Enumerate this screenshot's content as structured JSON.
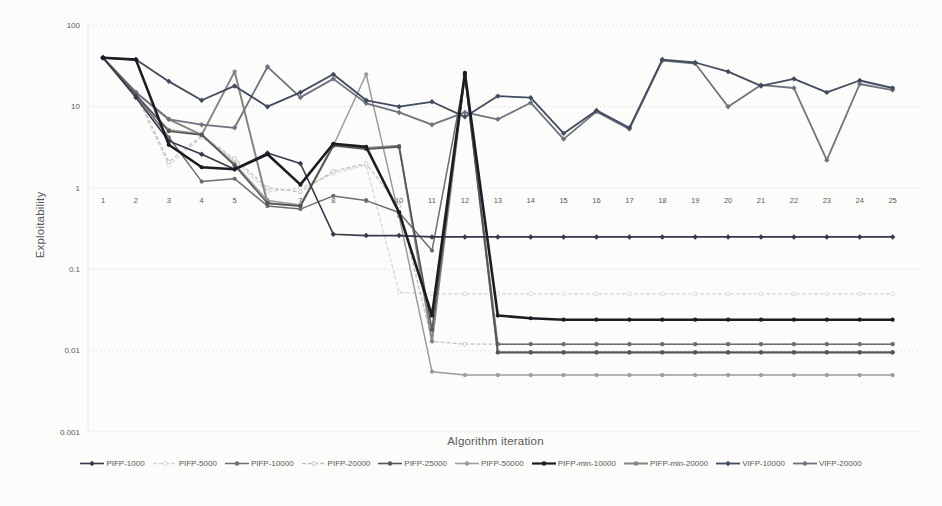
{
  "chart_data": {
    "type": "line",
    "title": "",
    "xlabel": "Algorithm iteration",
    "ylabel": "Exploitability",
    "yscale": "log",
    "ylim": [
      0.001,
      100
    ],
    "yticks": [
      100,
      10,
      1,
      0.1,
      0.01,
      0.001
    ],
    "ytick_labels": [
      "100",
      "10",
      "1",
      "0.1",
      "0.01",
      "0.001"
    ],
    "grid": true,
    "gridline_color": "#dbdbdb",
    "tick_label_color": "#595959",
    "legend_position": "bottom",
    "x": [
      1,
      2,
      3,
      4,
      5,
      6,
      7,
      8,
      9,
      10,
      11,
      12,
      13,
      14,
      15,
      16,
      17,
      18,
      19,
      20,
      21,
      22,
      23,
      24,
      25
    ],
    "series": [
      {
        "name": "PIFP-1000",
        "color": "#343a4c",
        "width": 1.6,
        "dash": "",
        "marker": "diamond",
        "values": [
          40,
          13,
          3.8,
          2.6,
          1.7,
          2.7,
          2.0,
          0.27,
          0.26,
          0.26,
          0.25,
          0.25,
          0.25,
          0.25,
          0.25,
          0.25,
          0.25,
          0.25,
          0.25,
          0.25,
          0.25,
          0.25,
          0.25,
          0.25,
          0.25
        ]
      },
      {
        "name": "PIFP-5000",
        "color": "#d7d7d7",
        "width": 1.3,
        "dash": "4 2",
        "marker": "circle-open",
        "values": [
          41,
          14,
          1.9,
          4.2,
          2.2,
          0.9,
          1.0,
          1.5,
          1.9,
          0.052,
          0.05,
          0.05,
          0.05,
          0.05,
          0.05,
          0.05,
          0.05,
          0.05,
          0.05,
          0.05,
          0.05,
          0.05,
          0.05,
          0.05,
          0.05
        ]
      },
      {
        "name": "PIFP-10000",
        "color": "#6d6d6d",
        "width": 1.5,
        "dash": "",
        "marker": "circle",
        "values": [
          40,
          14,
          4.2,
          1.2,
          1.3,
          0.6,
          0.55,
          0.8,
          0.7,
          0.5,
          0.17,
          24,
          0.012,
          0.012,
          0.012,
          0.012,
          0.012,
          0.012,
          0.012,
          0.012,
          0.012,
          0.012,
          0.012,
          0.012,
          0.012
        ]
      },
      {
        "name": "PIFP-20000",
        "color": "#c2c2c2",
        "width": 1.3,
        "dash": "4 2",
        "marker": "circle-open",
        "values": [
          40,
          15,
          2.1,
          4.4,
          2.3,
          1.0,
          0.9,
          1.6,
          2.0,
          0.6,
          0.013,
          0.012,
          0.012,
          0.012,
          0.012,
          0.012,
          0.012,
          0.012,
          0.012,
          0.012,
          0.012,
          0.012,
          0.012,
          0.012,
          0.012
        ]
      },
      {
        "name": "PIFP-25000",
        "color": "#555555",
        "width": 1.6,
        "dash": "",
        "marker": "circle",
        "values": [
          40,
          14,
          5.0,
          4.5,
          1.9,
          0.65,
          0.6,
          3.3,
          3.0,
          3.2,
          0.018,
          25,
          0.0095,
          0.0095,
          0.0095,
          0.0095,
          0.0095,
          0.0095,
          0.0095,
          0.0095,
          0.0095,
          0.0095,
          0.0095,
          0.0095,
          0.0095
        ]
      },
      {
        "name": "PIFP-50000",
        "color": "#9b9b9b",
        "width": 1.5,
        "dash": "",
        "marker": "circle",
        "values": [
          40,
          14,
          5.2,
          4.6,
          2.0,
          0.7,
          0.62,
          3.3,
          25,
          0.45,
          0.0055,
          0.005,
          0.005,
          0.005,
          0.005,
          0.005,
          0.005,
          0.005,
          0.005,
          0.005,
          0.005,
          0.005,
          0.005,
          0.005,
          0.005
        ]
      },
      {
        "name": "PIFP-min-10000",
        "color": "#1c1c22",
        "width": 2.6,
        "dash": "",
        "marker": "circle",
        "values": [
          40,
          38,
          3.4,
          1.8,
          1.7,
          2.6,
          1.1,
          3.5,
          3.2,
          0.5,
          0.027,
          26,
          0.027,
          0.025,
          0.024,
          0.024,
          0.024,
          0.024,
          0.024,
          0.024,
          0.024,
          0.024,
          0.024,
          0.024,
          0.024
        ]
      },
      {
        "name": "PIFP-min-20000",
        "color": "#858585",
        "width": 2.0,
        "dash": "",
        "marker": "circle",
        "values": [
          40,
          15,
          7.0,
          4.5,
          27,
          0.65,
          0.6,
          3.4,
          3.1,
          3.3,
          0.013,
          25,
          0.0095,
          0.0095,
          0.0095,
          0.0095,
          0.0095,
          0.0095,
          0.0095,
          0.0095,
          0.0095,
          0.0095,
          0.0095,
          0.0095,
          0.0095
        ]
      },
      {
        "name": "VIFP-10000",
        "color": "#434b5e",
        "width": 1.8,
        "dash": "",
        "marker": "diamond",
        "values": [
          40,
          38,
          20.5,
          12,
          18,
          10,
          15,
          25,
          12,
          10,
          11.5,
          7.5,
          13.5,
          12.9,
          4.7,
          9,
          5.5,
          38,
          35,
          27,
          18,
          22,
          15,
          21,
          17
        ]
      },
      {
        "name": "VIFP-20000",
        "color": "#6e737d",
        "width": 1.8,
        "dash": "",
        "marker": "diamond",
        "values": [
          40,
          15,
          7,
          6,
          5.5,
          31,
          13,
          22,
          11,
          8.5,
          6,
          8.5,
          7,
          11.2,
          4,
          8.7,
          5.3,
          37,
          34,
          10,
          18.5,
          17,
          2.2,
          19,
          16
        ]
      }
    ]
  }
}
